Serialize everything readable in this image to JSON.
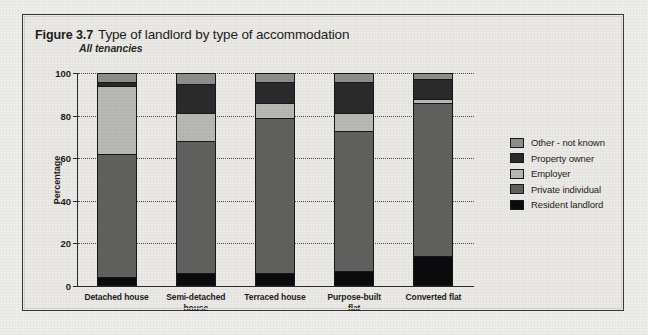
{
  "figure": {
    "number": "Figure 3.7",
    "title": "Type of landlord by type of accommodation",
    "subtitle": "All tenancies"
  },
  "legend": {
    "position": "right",
    "items": [
      {
        "label": "Other - not known",
        "color": "#8f8f8d"
      },
      {
        "label": "Property owner",
        "color": "#2b2b2d"
      },
      {
        "label": "Employer",
        "color": "#b9b9b6"
      },
      {
        "label": "Private individual",
        "color": "#616160"
      },
      {
        "label": "Resident landlord",
        "color": "#0c0c0e"
      }
    ]
  },
  "axes": {
    "ylabel": "Percentage",
    "yticks": [
      "0",
      "20",
      "40",
      "60",
      "80",
      "100"
    ],
    "ymin": 0,
    "ymax": 100
  },
  "chart_data": {
    "type": "bar",
    "title": "Type of landlord by type of accommodation",
    "subtitle": "All tenancies",
    "stacked": true,
    "stack_total": 100,
    "xlabel": "",
    "ylabel": "Percentage",
    "ylim": [
      0,
      100
    ],
    "ytick_step": 20,
    "grid": true,
    "legend_position": "right",
    "categories": [
      "Detached house",
      "Semi-detached house",
      "Terraced house",
      "Purpose-built flat",
      "Converted flat"
    ],
    "series": [
      {
        "name": "Resident landlord",
        "color": "#0c0c0e",
        "values": [
          4,
          6,
          6,
          7,
          14
        ]
      },
      {
        "name": "Private individual",
        "color": "#616160",
        "values": [
          58,
          62,
          73,
          66,
          72
        ]
      },
      {
        "name": "Employer",
        "color": "#b9b9b6",
        "values": [
          32,
          13,
          7,
          8,
          2
        ]
      },
      {
        "name": "Property owner",
        "color": "#2b2b2d",
        "values": [
          2,
          14,
          10,
          15,
          9
        ]
      },
      {
        "name": "Other - not known",
        "color": "#8f8f8d",
        "values": [
          4,
          5,
          4,
          4,
          3
        ]
      }
    ],
    "cumulative_tops": {
      "Detached house": [
        4,
        62,
        94,
        96,
        100
      ],
      "Semi-detached house": [
        6,
        68,
        81,
        95,
        100
      ],
      "Terraced house": [
        6,
        79,
        86,
        96,
        100
      ],
      "Purpose-built flat": [
        7,
        73,
        81,
        96,
        100
      ],
      "Converted flat": [
        14,
        86,
        88,
        97,
        100
      ]
    }
  }
}
